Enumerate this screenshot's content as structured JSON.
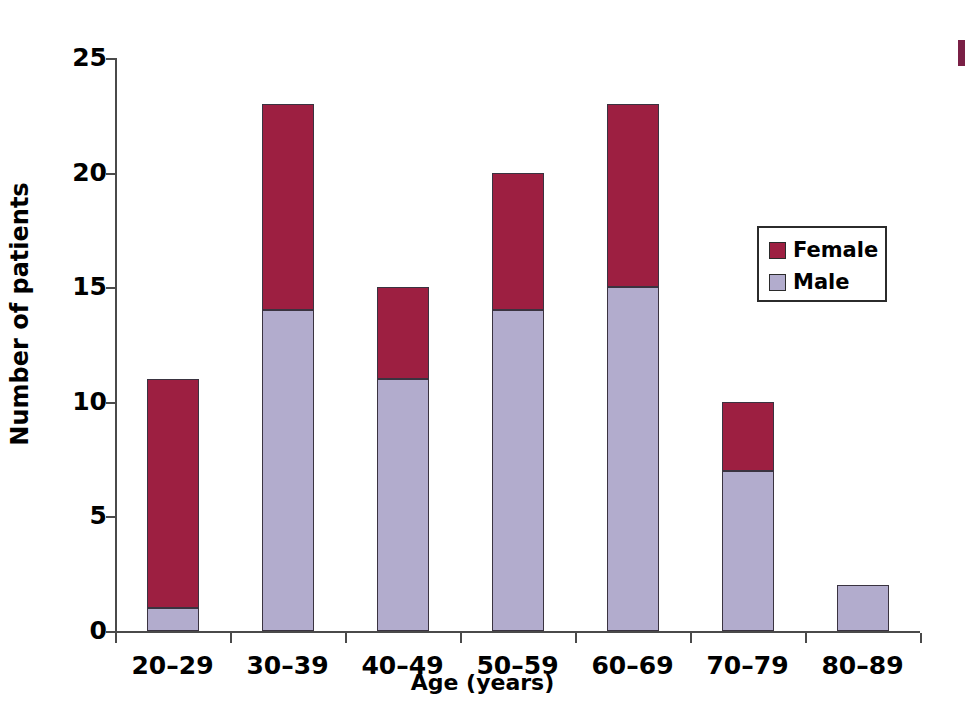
{
  "chart_data": {
    "type": "bar",
    "subtype": "stacked-vertical",
    "title": "",
    "xlabel": "Age (years)",
    "ylabel": "Number of patients",
    "categories": [
      "20–29",
      "30–39",
      "40–49",
      "50–59",
      "60–69",
      "70–79",
      "80–89"
    ],
    "series": [
      {
        "name": "Male",
        "color": "#b2accd",
        "values": [
          1,
          14,
          11,
          14,
          15,
          7,
          2
        ]
      },
      {
        "name": "Female",
        "color": "#9d1f41",
        "values": [
          10,
          9,
          4,
          6,
          8,
          3,
          0
        ]
      }
    ],
    "totals": [
      11,
      23,
      15,
      20,
      23,
      10,
      2
    ],
    "ylim": [
      0,
      25
    ],
    "yticks": [
      0,
      5,
      10,
      15,
      20,
      25
    ],
    "ytick_labels": [
      "0",
      "5",
      "10",
      "15",
      "20",
      "25"
    ],
    "grid": false,
    "legend_position": "inside-right",
    "legend_entries": [
      "Female",
      "Male"
    ],
    "stack_order_bottom_to_top": [
      "Male",
      "Female"
    ]
  },
  "axes": {
    "y_labels": [
      "25",
      "20",
      "15",
      "10",
      "5",
      "0"
    ],
    "y_title": "Number of patients",
    "x_title": "Age (years)",
    "x_labels": [
      "20–29",
      "30–39",
      "40–49",
      "50–59",
      "60–69",
      "70–79",
      "80–89"
    ]
  },
  "legend": {
    "items": [
      {
        "label": "Female",
        "color": "#9d1f41"
      },
      {
        "label": "Male",
        "color": "#b2accd"
      }
    ]
  },
  "colors": {
    "female": "#9d1f41",
    "male": "#b2accd",
    "axis": "#4a4a4a",
    "text": "#000000",
    "background": "#ffffff"
  }
}
